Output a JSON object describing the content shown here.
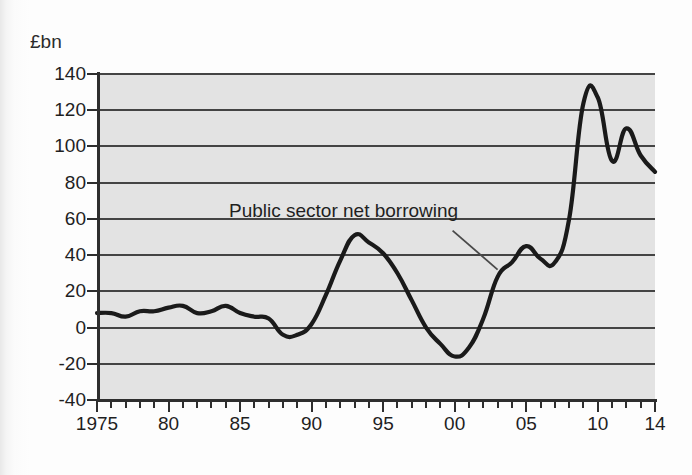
{
  "chart_data": {
    "type": "line",
    "title": "",
    "subtitle": "",
    "unit_label": "£bn",
    "xlabel": "",
    "ylabel": "",
    "ylim": [
      -40,
      140
    ],
    "xlim": [
      1975,
      2014
    ],
    "grid": true,
    "legend_position": "none",
    "ytick_labels": [
      "140",
      "120",
      "100",
      "80",
      "60",
      "40",
      "20",
      "0",
      "-20",
      "-40"
    ],
    "ytick_values": [
      140,
      120,
      100,
      80,
      60,
      40,
      20,
      0,
      -20,
      -40
    ],
    "xtick_labels": [
      "1975",
      "80",
      "85",
      "90",
      "95",
      "00",
      "05",
      "10",
      "14"
    ],
    "xtick_values": [
      1975,
      1980,
      1985,
      1990,
      1995,
      2000,
      2005,
      2010,
      2014
    ],
    "annotations": [
      {
        "text": "Public sector net borrowing",
        "points_to_year": 2003,
        "points_to_value": 32
      }
    ],
    "series": [
      {
        "name": "Public sector net borrowing",
        "color": "#1a1a1a",
        "x": [
          1975,
          1976,
          1977,
          1978,
          1979,
          1980,
          1981,
          1982,
          1983,
          1984,
          1985,
          1986,
          1987,
          1988,
          1989,
          1990,
          1991,
          1992,
          1993,
          1994,
          1995,
          1996,
          1997,
          1998,
          1999,
          2000,
          2001,
          2002,
          2003,
          2004,
          2005,
          2006,
          2007,
          2008,
          2009,
          2010,
          2011,
          2012,
          2013,
          2014
        ],
        "values": [
          8,
          8,
          6,
          9,
          9,
          11,
          12,
          8,
          9,
          12,
          8,
          6,
          5,
          -4,
          -4,
          2,
          18,
          37,
          51,
          47,
          41,
          30,
          15,
          0,
          -9,
          -16,
          -11,
          5,
          28,
          36,
          45,
          38,
          36,
          60,
          124,
          127,
          92,
          110,
          95,
          86
        ]
      }
    ]
  },
  "plot_area": {
    "background_color": "#e3e3e3",
    "gridline_color": "#444444",
    "axis_color": "#2e2e2e"
  }
}
